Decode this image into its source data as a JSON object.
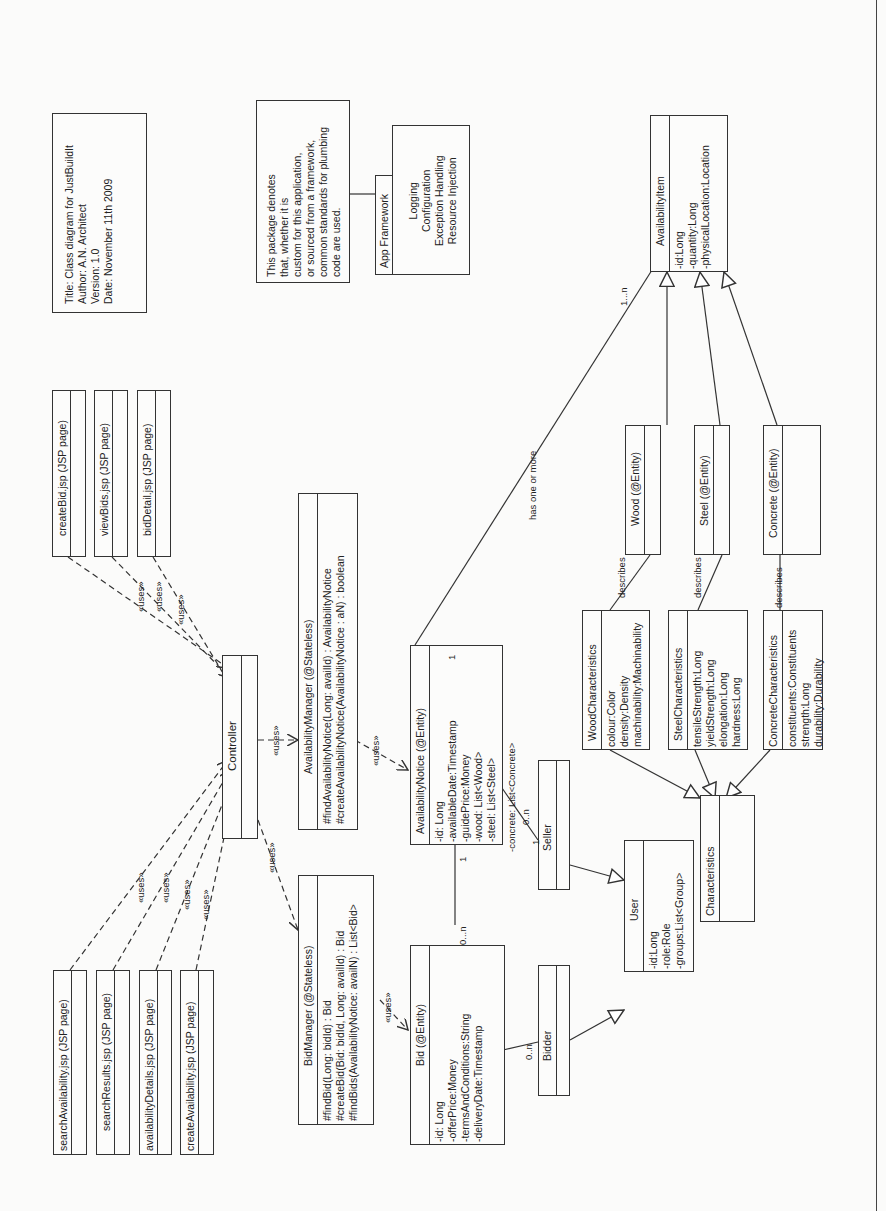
{
  "title_note": {
    "lines": [
      "Title: Class diagram for JustBuildIt",
      "Author: A.N. Architect",
      "Version: 1.0",
      "Date: November 11th 2009"
    ]
  },
  "package_note": {
    "lines": [
      "This package denotes",
      "that, whether it is",
      "custom for this application,",
      "or sourced from a framework,",
      "common standards for plumbing",
      "code are used."
    ]
  },
  "app_framework": {
    "tab": "App Framework",
    "items": [
      "Logging",
      "Configuration",
      "Exception Handling",
      "Resource Injection"
    ]
  },
  "jsp_pages": {
    "top": [
      "createBid.jsp (JSP page)",
      "viewBids.jsp (JSP page)",
      "bidDetail.jsp (JSP page)"
    ],
    "bottom": [
      "searchAvailability.jsp (JSP page)",
      "searchResults.jsp (JSP page)",
      "availabilityDetails.jsp (JSP page)",
      "createAvailability.jsp (JSP page)"
    ]
  },
  "controller": {
    "name": "Controller"
  },
  "availability_manager": {
    "name": "AvailabilityManager (@Stateless)",
    "ops": [
      "#findAvailabilityNotice(Long: availId) : AvailabilityNotice",
      "#createAvailabilityNotice(AvailabilityNotice : aN) : boolean"
    ]
  },
  "bid_manager": {
    "name": "BidManager (@Stateless)",
    "ops": [
      "#findBid(Long: bidId) : Bid",
      "#createBid(Bid: bidId, Long: availId) : Bid",
      "#findBids(AvailabilityNotice: availN) : List<Bid>"
    ]
  },
  "availability_notice": {
    "name": "AvailabilityNotice (@Entity)",
    "attrs": [
      "-id: Long",
      "-availableDate:Timestamp",
      "-guidePrice:Money",
      "-wood: List<Wood>",
      "-steel: List<Steel>",
      "-concrete: List<Concrete>"
    ]
  },
  "bid": {
    "name": "Bid (@Entity)",
    "attrs": [
      "-id: Long",
      "-offerPrice:Money",
      "-termsAndConditions:String",
      "-deliveryDate:Timestamp"
    ]
  },
  "seller": {
    "name": "Seller"
  },
  "bidder": {
    "name": "Bidder"
  },
  "user": {
    "name": "User",
    "attrs": [
      "-id:Long",
      "-role:Role",
      "-groups:List<Group>"
    ]
  },
  "availability_item": {
    "name": "AvailabilityItem",
    "attrs": [
      "-id:Long",
      "-quantity:Long",
      "-physicalLocation:Location"
    ]
  },
  "wood": {
    "name": "Wood (@Entity)"
  },
  "steel": {
    "name": "Steel (@Entity)"
  },
  "concrete": {
    "name": "Concrete (@Entity)"
  },
  "wood_chars": {
    "name": "WoodCharacteristics",
    "attrs": [
      "colour:Color",
      "density:Density",
      "machinability:Machinability"
    ]
  },
  "steel_chars": {
    "name": "SteelCharacteristics",
    "attrs": [
      "tensileStrength:Long",
      "yieldStrength:Long",
      "elongation:Long",
      "hardness:Long"
    ]
  },
  "concrete_chars": {
    "name": "ConcreteCharacteristics",
    "attrs": [
      "constituents:Constituents",
      "strength:Long",
      "durability:Durability"
    ]
  },
  "characteristics": {
    "name": "Characteristics"
  },
  "labels": {
    "uses": "«uses»",
    "describes": "describes",
    "has_one_or_more": "has one or more",
    "mult_1": "1",
    "mult_1n": "1...n",
    "mult_0n": "0...n",
    "mult_0n_short": "0..n"
  }
}
